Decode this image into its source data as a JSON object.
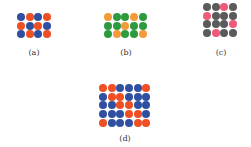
{
  "colors": {
    "blue": "#2f4fa0",
    "red": "#f04e23",
    "green": "#2e9a3e",
    "orange": "#f39b3a",
    "gray": "#5a5a5a",
    "pink": "#ee5a78"
  },
  "panels": [
    {
      "id": "a",
      "label": "(a)",
      "x": 17,
      "y": 13,
      "cols": 4,
      "label_x": 34,
      "label_y": 49,
      "grid": [
        [
          "blue",
          "red",
          "blue",
          "red"
        ],
        [
          "red",
          "blue",
          "red",
          "blue"
        ],
        [
          "blue",
          "red",
          "blue",
          "red"
        ]
      ]
    },
    {
      "id": "b",
      "label": "(b)",
      "x": 104,
      "y": 13,
      "cols": 5,
      "label_x": 126,
      "label_y": 49,
      "grid": [
        [
          "orange",
          "green",
          "green",
          "orange",
          "green"
        ],
        [
          "green",
          "green",
          "orange",
          "green",
          "green"
        ],
        [
          "green",
          "orange",
          "green",
          "green",
          "orange"
        ]
      ]
    },
    {
      "id": "c",
      "label": "(c)",
      "x": 203,
      "y": 3,
      "cols": 4,
      "label_x": 221,
      "label_y": 49,
      "grid": [
        [
          "gray",
          "gray",
          "pink",
          "gray"
        ],
        [
          "pink",
          "gray",
          "gray",
          "gray"
        ],
        [
          "gray",
          "gray",
          "gray",
          "pink"
        ],
        [
          "gray",
          "pink",
          "gray",
          "gray"
        ]
      ]
    },
    {
      "id": "d",
      "label": "(d)",
      "x": 99,
      "y": 84,
      "cols": 6,
      "label_x": 125,
      "label_y": 135,
      "grid": [
        [
          "red",
          "red",
          "blue",
          "blue",
          "blue",
          "red"
        ],
        [
          "blue",
          "red",
          "red",
          "blue",
          "blue",
          "blue"
        ],
        [
          "blue",
          "blue",
          "red",
          "red",
          "blue",
          "blue"
        ],
        [
          "blue",
          "blue",
          "blue",
          "red",
          "red",
          "blue"
        ],
        [
          "red",
          "blue",
          "blue",
          "blue",
          "red",
          "red"
        ]
      ]
    }
  ]
}
